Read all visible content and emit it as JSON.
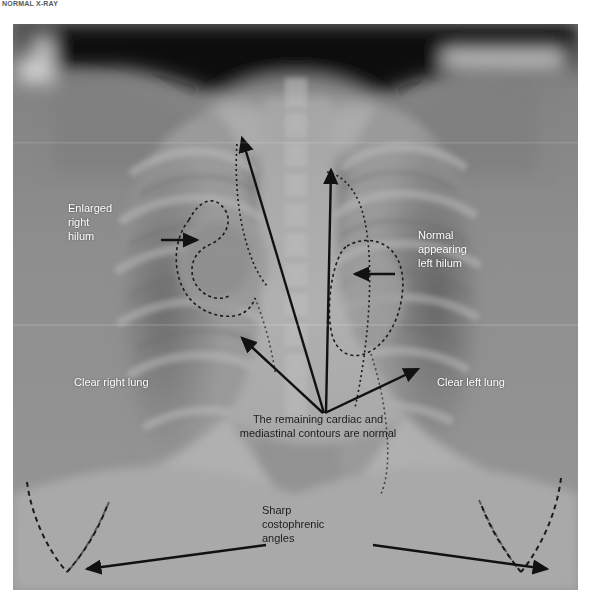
{
  "header": {
    "title": "NORMAL X-RAY"
  },
  "image": {
    "kind": "chest-radiograph",
    "view": "frontal PA chest X-ray",
    "background_color": "#8b8b8b",
    "frame": {
      "left": 13,
      "top": 24,
      "width": 565,
      "height": 566
    }
  },
  "annotations": {
    "enlarged_right_hilum": "Enlarged\nright\nhilum",
    "normal_left_hilum": "Normal\nappearing\nleft hilum",
    "clear_right_lung": "Clear right lung",
    "clear_left_lung": "Clear left lung",
    "cardiac_contours": "The remaining cardiac and\nmediastinal contours are normal",
    "costophrenic_angles": "Sharp\ncostophrenic\nangles"
  },
  "markup": {
    "arrow_color": "#111111",
    "dashed_outline_color": "#1a1a1a",
    "label_color_light": "#ffffff",
    "label_color_dark": "#1d1d1d"
  }
}
